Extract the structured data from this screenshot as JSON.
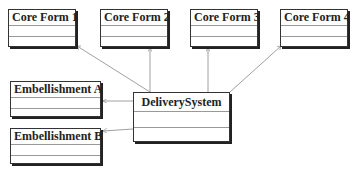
{
  "diagram": {
    "type": "uml-class",
    "classes": [
      {
        "id": "core1",
        "name": "Core Form 1"
      },
      {
        "id": "core2",
        "name": "Core Form 2"
      },
      {
        "id": "core3",
        "name": "Core Form 3"
      },
      {
        "id": "core4",
        "name": "Core Form 4"
      },
      {
        "id": "embA",
        "name": "Embellishment A"
      },
      {
        "id": "embB",
        "name": "Embellishment B"
      },
      {
        "id": "delivery",
        "name": "DeliverySystem"
      }
    ],
    "relationships": [
      {
        "from": "delivery",
        "to": "core1",
        "type": "association"
      },
      {
        "from": "delivery",
        "to": "core2",
        "type": "association"
      },
      {
        "from": "delivery",
        "to": "core3",
        "type": "association"
      },
      {
        "from": "delivery",
        "to": "core4",
        "type": "association"
      },
      {
        "from": "delivery",
        "to": "embA",
        "type": "association"
      },
      {
        "from": "delivery",
        "to": "embB",
        "type": "association"
      }
    ],
    "colors": {
      "line": "#888888",
      "border": "#333333",
      "text": "#222222"
    }
  }
}
